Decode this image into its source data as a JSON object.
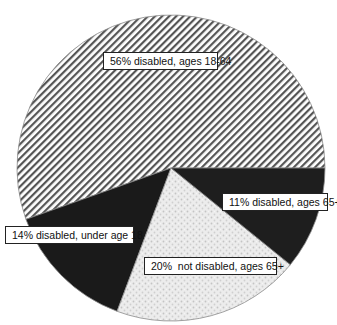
{
  "chart_data": {
    "type": "pie",
    "title": "",
    "start_angle_deg": 0,
    "direction": "counterclockwise",
    "slices": [
      {
        "label": "56% disabled, ages 18-64",
        "category": "disabled, ages 18-64",
        "value": 56,
        "fill": "diagonal-hatch",
        "color": "#555555"
      },
      {
        "label": "14% disabled, under age 18",
        "category": "disabled, under age 18",
        "value": 14,
        "fill": "solid-dark",
        "color": "#1a1a1a"
      },
      {
        "label": "20%  not disabled, ages 65+",
        "category": "not disabled, ages 65+",
        "value": 20,
        "fill": "light-stipple",
        "color": "#e4e4e4"
      },
      {
        "label": "11% disabled, ages 65+",
        "category": "disabled, ages 65+",
        "value": 11,
        "fill": "solid-dark",
        "color": "#1e1e1e"
      }
    ],
    "categories": [
      "disabled, ages 18-64",
      "disabled, under age 18",
      "not disabled, ages 65+",
      "disabled, ages 65+"
    ],
    "values": [
      56,
      14,
      20,
      11
    ],
    "legend": "none (inline labels)"
  },
  "labels": {
    "slice_56": "56% disabled, ages 18-64",
    "slice_11": "11% disabled, ages 65+",
    "slice_14": "14% disabled, under age 18",
    "slice_20": "20%  not disabled, ages 65+"
  }
}
